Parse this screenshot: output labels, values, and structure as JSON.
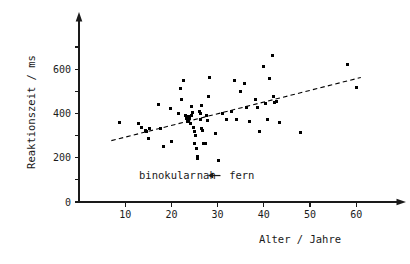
{
  "chart_data": {
    "type": "scatter",
    "title": "",
    "xlabel": "Alter / Jahre",
    "ylabel": "Reaktionszeit / ms",
    "xlim": [
      0,
      66
    ],
    "ylim": [
      0,
      700
    ],
    "grid": false,
    "legend_position": "none",
    "x_ticks": [
      10,
      20,
      30,
      40,
      50,
      60
    ],
    "x_tick_labels": [
      "10",
      "20",
      "30",
      "40",
      "50",
      "60"
    ],
    "x_minor_ticks": [],
    "y_ticks": [
      0,
      200,
      400,
      600
    ],
    "y_tick_labels": [
      "0",
      "200",
      "400",
      "600"
    ],
    "y_minor_ticks": [
      100,
      300,
      500,
      700
    ],
    "marker": "square",
    "marker_color": "#000000",
    "marker_size_px": 3,
    "annotations": [
      {
        "text": "binokular",
        "x": 13,
        "y": 105
      },
      {
        "text": "nah",
        "x": 25.5,
        "y": 105
      },
      {
        "text": "fern",
        "x": 32.5,
        "y": 105
      },
      {
        "text": "arrow-left",
        "x": 29,
        "y": 105
      }
    ],
    "trendline": {
      "style": "dashed",
      "color": "#000000",
      "x_start": 7,
      "y_start": 277,
      "x_end": 61,
      "y_end": 562
    },
    "series": [
      {
        "name": "binokular nah-fern",
        "points": [
          [
            8.7,
            357
          ],
          [
            12.8,
            355
          ],
          [
            13.6,
            338
          ],
          [
            14.3,
            325
          ],
          [
            14.6,
            318
          ],
          [
            15.2,
            330
          ],
          [
            15.0,
            285
          ],
          [
            17.3,
            440
          ],
          [
            17.6,
            330
          ],
          [
            18.2,
            250
          ],
          [
            19.8,
            420
          ],
          [
            20.0,
            272
          ],
          [
            21.5,
            400
          ],
          [
            22.0,
            512
          ],
          [
            22.2,
            463
          ],
          [
            22.6,
            548
          ],
          [
            23.0,
            392
          ],
          [
            23.2,
            375
          ],
          [
            23.4,
            362
          ],
          [
            23.6,
            385
          ],
          [
            23.8,
            368
          ],
          [
            24.0,
            378
          ],
          [
            24.2,
            353
          ],
          [
            24.4,
            390
          ],
          [
            24.6,
            405
          ],
          [
            24.3,
            430
          ],
          [
            24.8,
            337
          ],
          [
            25.0,
            320
          ],
          [
            25.2,
            300
          ],
          [
            25.1,
            262
          ],
          [
            25.4,
            240
          ],
          [
            25.6,
            205
          ],
          [
            25.7,
            197
          ],
          [
            26.0,
            410
          ],
          [
            26.2,
            398
          ],
          [
            26.4,
            372
          ],
          [
            26.6,
            330
          ],
          [
            26.8,
            322
          ],
          [
            26.5,
            437
          ],
          [
            27.0,
            262
          ],
          [
            27.4,
            262
          ],
          [
            27.6,
            390
          ],
          [
            27.8,
            370
          ],
          [
            28.0,
            478
          ],
          [
            28.2,
            563
          ],
          [
            29.5,
            310
          ],
          [
            30.2,
            188
          ],
          [
            31.0,
            398
          ],
          [
            32.0,
            372
          ],
          [
            33.0,
            408
          ],
          [
            33.6,
            548
          ],
          [
            34.0,
            372
          ],
          [
            35.0,
            500
          ],
          [
            35.8,
            537
          ],
          [
            36.2,
            425
          ],
          [
            37.0,
            362
          ],
          [
            38.2,
            465
          ],
          [
            38.6,
            425
          ],
          [
            39.0,
            318
          ],
          [
            40.0,
            612
          ],
          [
            40.4,
            445
          ],
          [
            40.8,
            372
          ],
          [
            41.2,
            557
          ],
          [
            41.8,
            663
          ],
          [
            42.0,
            478
          ],
          [
            42.4,
            448
          ],
          [
            42.8,
            452
          ],
          [
            43.4,
            360
          ],
          [
            48.0,
            312
          ],
          [
            58.2,
            622
          ],
          [
            60.0,
            515
          ]
        ]
      }
    ]
  },
  "axes": {
    "y_axis_arrow": true,
    "x_axis_arrow": true
  }
}
